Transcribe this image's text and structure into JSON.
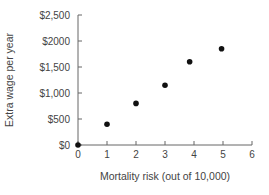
{
  "chart_data": {
    "type": "scatter",
    "title": "",
    "xlabel": "Mortality risk (out of 10,000)",
    "ylabel": "Extra wage per year",
    "xlim": [
      0,
      6
    ],
    "ylim": [
      0,
      2500
    ],
    "x_ticks": [
      "0",
      "1",
      "2",
      "3",
      "4",
      "5",
      "6"
    ],
    "y_ticks": [
      "$0",
      "$500",
      "$1,000",
      "$1,500",
      "$2000",
      "$2,500"
    ],
    "grid": false,
    "legend": null,
    "series": [
      {
        "name": "Wage premium",
        "x": [
          0,
          1,
          2,
          3,
          3.85,
          4.95
        ],
        "y": [
          0,
          400,
          800,
          1150,
          1600,
          1850
        ]
      }
    ]
  }
}
